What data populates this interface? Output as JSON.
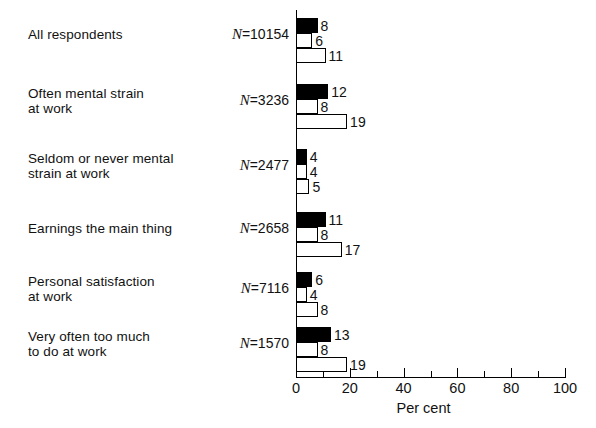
{
  "chart_data": {
    "type": "bar",
    "orientation": "horizontal",
    "title": "",
    "xlabel": "Per cent",
    "ylabel": "",
    "xlim": [
      0,
      100
    ],
    "xticks": [
      0,
      10,
      20,
      30,
      40,
      50,
      60,
      70,
      80,
      90,
      100
    ],
    "xtick_labels": [
      "0",
      "",
      "20",
      "",
      "40",
      "",
      "60",
      "",
      "80",
      "",
      "100"
    ],
    "grid": false,
    "legend": "none",
    "categories": [
      "All respondents",
      "Often mental strain\nat work",
      "Seldom or never mental\nstrain at work",
      "Earnings the main thing",
      "Personal satisfaction\nat work",
      "Very often too much\nto do at work"
    ],
    "category_n_labels": [
      "N=10154",
      "N=3236",
      "N=2477",
      "N=2658",
      "N=7116",
      "N=1570"
    ],
    "category_n_values": [
      10154,
      3236,
      2477,
      2658,
      7116,
      1570
    ],
    "series": [
      {
        "name": "series-1-black",
        "fill": "black",
        "values": [
          8,
          12,
          4,
          11,
          6,
          13
        ]
      },
      {
        "name": "series-2-stipple",
        "fill": "stipple",
        "values": [
          6,
          8,
          4,
          8,
          4,
          8
        ]
      },
      {
        "name": "series-3-white",
        "fill": "white",
        "values": [
          11,
          19,
          5,
          17,
          8,
          19
        ]
      }
    ]
  },
  "axis": {
    "tick_labels": [
      "0",
      "20",
      "40",
      "60",
      "80",
      "100"
    ],
    "tick_values": [
      0,
      20,
      40,
      60,
      80,
      100
    ],
    "title": "Per cent"
  },
  "colors": {
    "ink": "#000000",
    "background": "#ffffff",
    "series_black": "#000000",
    "series_stipple": "#b8b8b8",
    "series_white": "#ffffff"
  }
}
